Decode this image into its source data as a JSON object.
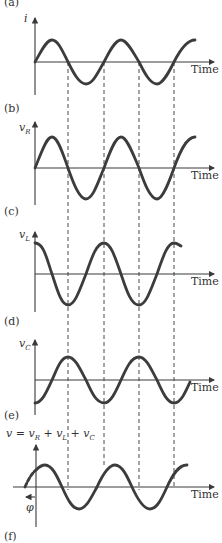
{
  "figure": {
    "panel_labels": [
      "(a)",
      "(b)",
      "(c)",
      "(d)",
      "(e)",
      "(f)"
    ],
    "x_axis_label": "Time",
    "panels": [
      {
        "id": "current",
        "y_label": "i",
        "y_sub": "",
        "waveform": "sine",
        "phase": "0",
        "caption": "(b)"
      },
      {
        "id": "resistor_voltage",
        "y_label": "v",
        "y_sub": "R",
        "waveform": "sine",
        "phase": "in phase with i",
        "caption": "(c)"
      },
      {
        "id": "inductor_voltage",
        "y_label": "v",
        "y_sub": "L",
        "waveform": "cosine",
        "phase": "leads i by 90°",
        "caption": "(d)"
      },
      {
        "id": "capacitor_voltage",
        "y_label": "v",
        "y_sub": "C",
        "waveform": "-cosine",
        "phase": "lags i by 90°",
        "caption": "(e)"
      },
      {
        "id": "total_voltage",
        "y_label": "v = v",
        "formula": [
          "v = v",
          "R",
          " + v",
          "L",
          " + v",
          "C"
        ],
        "waveform": "sine",
        "phase": "leads by φ",
        "caption": "(f)"
      }
    ],
    "phase_symbol": "φ",
    "colors": {
      "curve": "#3c3c3c",
      "axis": "#3a3a3a",
      "background": "#ffffff"
    }
  }
}
